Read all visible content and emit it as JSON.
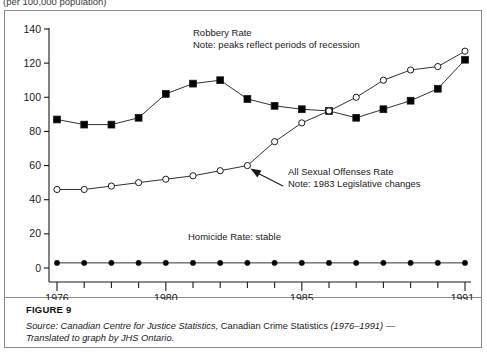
{
  "header": {
    "unit_note": "(per 100,000 population)"
  },
  "figure": {
    "label": "FIGURE 9",
    "source_prefix": "Source: Canadian Centre for Justice Statistics,",
    "source_title": "Canadian Crime Statistics",
    "source_years": "(1976–1991)",
    "source_dash": "—",
    "source_line2": "Translated to graph by JHS Ontario."
  },
  "annotations": {
    "robbery_title": "Robbery Rate",
    "robbery_note": "Note: peaks reflect periods of recession",
    "sexual_title": "All Sexual Offenses Rate",
    "sexual_note": "Note: 1983 Legislative changes",
    "homicide_note": "Homicide Rate: stable"
  },
  "colors": {
    "line": "#1a1a1a",
    "frame": "#8a8a8a",
    "axis": "#1a1a1a",
    "marker_fill": "#000000",
    "marker_open": "#ffffff"
  },
  "chart_data": {
    "type": "line",
    "title": "",
    "subtitle": "(per 100,000 population)",
    "xlabel": "",
    "ylabel": "",
    "ylim": [
      0,
      140
    ],
    "ytick_values": [
      0,
      20,
      40,
      60,
      80,
      100,
      120,
      140
    ],
    "ytick_labels": [
      "0",
      "20",
      "40",
      "60",
      "80",
      "100",
      "120",
      "140"
    ],
    "grid": false,
    "legend_position": "inline-annotations",
    "x": [
      1976,
      1977,
      1978,
      1979,
      1980,
      1981,
      1982,
      1983,
      1984,
      1985,
      1986,
      1987,
      1988,
      1989,
      1990,
      1991
    ],
    "xtick_values": [
      1976,
      1977,
      1978,
      1979,
      1980,
      1981,
      1982,
      1983,
      1984,
      1985,
      1986,
      1987,
      1988,
      1989,
      1990,
      1991
    ],
    "xtick_labeled": [
      1976,
      1980,
      1985,
      1991
    ],
    "xtick_labels": [
      "1976",
      "1980",
      "1985",
      "1991"
    ],
    "series": [
      {
        "name": "Robbery Rate",
        "marker": "filled-square",
        "values": [
          87,
          84,
          84,
          88,
          102,
          108,
          110,
          99,
          95,
          93,
          92,
          88,
          93,
          98,
          105,
          122
        ]
      },
      {
        "name": "All Sexual Offenses Rate",
        "marker": "open-circle",
        "values": [
          46,
          46,
          48,
          50,
          52,
          54,
          57,
          60,
          74,
          85,
          92,
          100,
          110,
          116,
          118,
          127
        ]
      },
      {
        "name": "Homicide Rate",
        "marker": "filled-circle",
        "values": [
          3,
          3,
          3,
          3,
          3,
          3,
          3,
          3,
          3,
          3,
          3,
          3,
          3,
          3,
          3,
          3
        ]
      }
    ]
  }
}
